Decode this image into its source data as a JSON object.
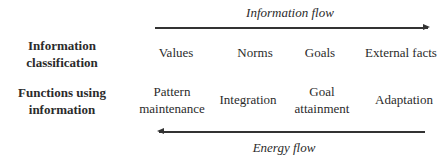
{
  "information_flow": {
    "label": "Information flow",
    "direction": "right"
  },
  "energy_flow": {
    "label": "Energy flow",
    "direction": "left"
  },
  "rows": [
    {
      "label_line1": "Information",
      "label_line2": "classification",
      "cells": [
        {
          "line1": "Values",
          "line2": ""
        },
        {
          "line1": "Norms",
          "line2": ""
        },
        {
          "line1": "Goals",
          "line2": ""
        },
        {
          "line1": "External facts",
          "line2": ""
        }
      ]
    },
    {
      "label_line1": "Functions using",
      "label_line2": "information",
      "cells": [
        {
          "line1": "Pattern",
          "line2": "maintenance"
        },
        {
          "line1": "Integration",
          "line2": ""
        },
        {
          "line1": "Goal",
          "line2": "attainment"
        },
        {
          "line1": "Adaptation",
          "line2": ""
        }
      ]
    }
  ],
  "colors": {
    "text": "#2b2b2b",
    "arrow": "#333333",
    "background": "#ffffff"
  }
}
